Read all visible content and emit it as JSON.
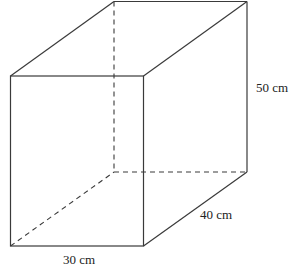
{
  "diagram": {
    "type": "cuboid",
    "labels": {
      "height": "50 cm",
      "depth": "40 cm",
      "width": "30 cm"
    },
    "colors": {
      "stroke": "#3a3a3a",
      "text": "#222222"
    }
  }
}
